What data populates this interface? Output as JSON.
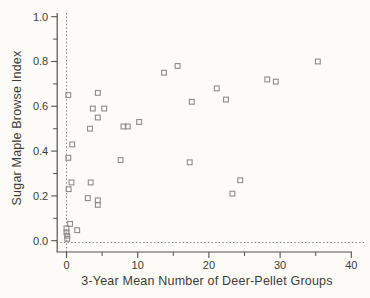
{
  "chart_data": {
    "type": "scatter",
    "title": "",
    "xlabel": "3-Year Mean Number of Deer-Pellet Groups",
    "ylabel": "Sugar Maple Browse Index",
    "xlim": [
      0,
      40
    ],
    "ylim": [
      0.0,
      1.0
    ],
    "grid": false,
    "legend": null,
    "marker": "open-square",
    "x_ticks": {
      "major": [
        0,
        10,
        20,
        30,
        40
      ],
      "minor": [
        5,
        15,
        25,
        35
      ],
      "labels": [
        "0",
        "10",
        "20",
        "30",
        "40"
      ]
    },
    "y_ticks": {
      "major": [
        0.0,
        0.2,
        0.4,
        0.6,
        0.8,
        1.0
      ],
      "minor": [
        0.1,
        0.3,
        0.5,
        0.7,
        0.9
      ],
      "labels": [
        "0.0",
        "0.2",
        "0.4",
        "0.6",
        "0.8",
        "1.0"
      ]
    },
    "reference_lines": {
      "vertical_dotted_at_x": 0,
      "horizontal_dotted_at_y": 0
    },
    "points": [
      [
        0.25,
        0.65
      ],
      [
        4.4,
        0.66
      ],
      [
        3.7,
        0.59
      ],
      [
        5.3,
        0.59
      ],
      [
        4.4,
        0.55
      ],
      [
        3.3,
        0.5
      ],
      [
        8.0,
        0.51
      ],
      [
        8.6,
        0.51
      ],
      [
        10.2,
        0.53
      ],
      [
        0.8,
        0.43
      ],
      [
        0.25,
        0.37
      ],
      [
        7.6,
        0.36
      ],
      [
        13.7,
        0.75
      ],
      [
        15.6,
        0.78
      ],
      [
        21.1,
        0.68
      ],
      [
        28.2,
        0.72
      ],
      [
        29.4,
        0.71
      ],
      [
        35.3,
        0.8
      ],
      [
        17.6,
        0.62
      ],
      [
        22.4,
        0.63
      ],
      [
        17.3,
        0.35
      ],
      [
        24.4,
        0.27
      ],
      [
        23.3,
        0.21
      ],
      [
        0.7,
        0.26
      ],
      [
        0.3,
        0.23
      ],
      [
        3.4,
        0.26
      ],
      [
        3.0,
        0.19
      ],
      [
        4.4,
        0.18
      ],
      [
        4.4,
        0.16
      ],
      [
        0.5,
        0.075
      ],
      [
        0.0,
        0.055
      ],
      [
        0.0,
        0.037
      ],
      [
        0.1,
        0.022
      ],
      [
        1.5,
        0.047
      ],
      [
        0.1,
        0.008
      ]
    ]
  },
  "style": {
    "background": "#fcfbf8",
    "axis_color": "#55524e",
    "text_color": "#3e3a35",
    "marker_color": "#8e8c89",
    "dotted_line_color": "#75726d"
  }
}
